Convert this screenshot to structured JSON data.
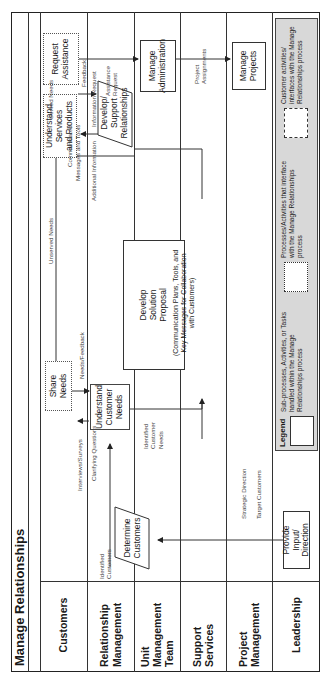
{
  "title": "Manage Relationships",
  "lanes": [
    {
      "id": "customers",
      "label": "Customers"
    },
    {
      "id": "relationship-management",
      "label": "Relationship Management"
    },
    {
      "id": "unit-management-team",
      "label": "Unit Management Team"
    },
    {
      "id": "support-services",
      "label": "Support Services"
    },
    {
      "id": "project-management",
      "label": "Project Management"
    },
    {
      "id": "leadership",
      "label": "Leadership"
    }
  ],
  "nodes": {
    "request_assistance": {
      "l1": "Request",
      "l2": "Assistance"
    },
    "understand_services": {
      "l1": "Understand",
      "l2": "Services",
      "l3": "and Products"
    },
    "share_needs": {
      "l1": "Share",
      "l2": "Needs"
    },
    "develop_support": {
      "l1": "Develop/",
      "l2": "Support",
      "l3": "Relationships"
    },
    "understand_customer_needs": {
      "l1": "Understand",
      "l2": "Customer",
      "l3": "Needs"
    },
    "determine_customers": {
      "l1": "Determine",
      "l2": "Customers"
    },
    "develop_solution": {
      "l1": "Develop",
      "l2": "Solution",
      "l3": "Proposal",
      "sub": "(Communication Plans, Tools, and Key Messages for Collaboration with Customers)"
    },
    "manage_administration": {
      "l1": "Manage",
      "l2": "Administration"
    },
    "manage_projects": {
      "l1": "Manage",
      "l2": "Projects"
    },
    "provide_input": {
      "l1": "Provide",
      "l2": "Input/",
      "l3": "Direction"
    }
  },
  "flow_labels": {
    "served_needs": "Served Needs",
    "unserved_needs": "Unserved Needs",
    "feedback": "Feedback",
    "information_request": "Information Request",
    "communicated_1": "Communicated",
    "communicated_2": "Messages and Tools",
    "additional_information": "Additional Information",
    "needs_feedback": "Needs/Feedback",
    "interviews_surveys": "Interviews/Surveys",
    "clarifying_questions": "Clarifying Questions",
    "identified_customer_needs_1": "Identified",
    "identified_customer_needs_2": "Customer",
    "identified_customer_needs_3": "Needs",
    "identified_customers_1": "Identified",
    "identified_customers_2": "Customers",
    "assistance_request_1": "Assistance",
    "assistance_request_2": "Request",
    "project_assignments_1": "Project",
    "project_assignments_2": "Assignments",
    "strategic_direction": "Strategic Direction",
    "target_customers": "Target Customers"
  },
  "legend": {
    "title": "Legend",
    "items": [
      {
        "style": "solid",
        "text": "Sub-processes, Activities, or Tasks handled within the Manage Relationships process"
      },
      {
        "style": "dotted",
        "text": "Processes/Activities that interface with the Manage Relationships process"
      },
      {
        "style": "dashed",
        "text": "Customer activities/ interfaces with the Manage Relationships process"
      }
    ]
  },
  "colors": {
    "legend_bg": "#d8d8d8",
    "line": "#333333"
  }
}
